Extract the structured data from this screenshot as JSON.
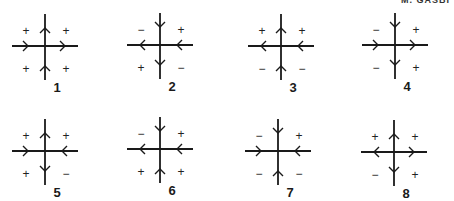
{
  "header": {
    "cropped_text": "M. GASBI"
  },
  "diagrams": [
    {
      "label": "1",
      "h_left": "right",
      "h_right": "right",
      "v_top": "up",
      "v_bottom": "up",
      "signs": [
        "+",
        "+",
        "+",
        "+"
      ]
    },
    {
      "label": "2",
      "h_left": "left",
      "h_right": "left",
      "v_top": "down",
      "v_bottom": "down",
      "signs": [
        "−",
        "+",
        "+",
        "−"
      ]
    },
    {
      "label": "3",
      "h_left": "left",
      "h_right": "left",
      "v_top": "up",
      "v_bottom": "up",
      "signs": [
        "+",
        "+",
        "−",
        "−"
      ]
    },
    {
      "label": "4",
      "h_left": "right",
      "h_right": "right",
      "v_top": "down",
      "v_bottom": "down",
      "signs": [
        "−",
        "+",
        "−",
        "+"
      ]
    },
    {
      "label": "5",
      "h_left": "right",
      "h_right": "left",
      "v_top": "up",
      "v_bottom": "down",
      "signs": [
        "+",
        "+",
        "+",
        "−"
      ]
    },
    {
      "label": "6",
      "h_left": "left",
      "h_right": "left",
      "v_top": "down",
      "v_bottom": "up",
      "signs": [
        "−",
        "+",
        "+",
        "+"
      ]
    },
    {
      "label": "7",
      "h_left": "right",
      "h_right": "left",
      "v_top": "down",
      "v_bottom": "up",
      "signs": [
        "−",
        "+",
        "−",
        "−"
      ]
    },
    {
      "label": "8",
      "h_left": "left",
      "h_right": "right",
      "v_top": "up",
      "v_bottom": "down",
      "signs": [
        "+",
        "+",
        "−",
        "+"
      ]
    }
  ],
  "colors": {
    "ink": "#1a1a1a",
    "background": "#ffffff"
  }
}
